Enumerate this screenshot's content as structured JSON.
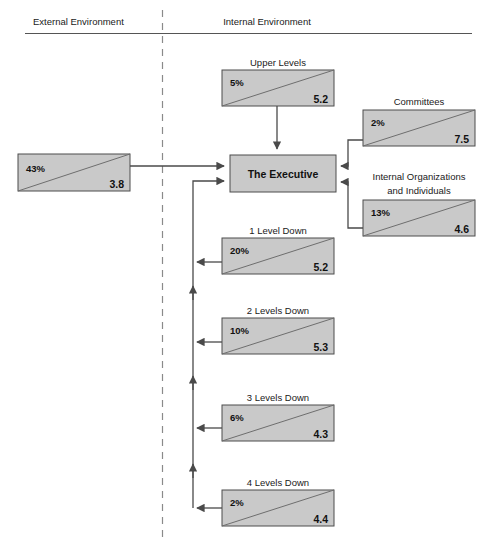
{
  "header": {
    "external_label": "External Environment",
    "internal_label": "Internal Environment"
  },
  "nodes": {
    "external": {
      "caption": "",
      "percent": "43%",
      "value": "3.8"
    },
    "upper_levels": {
      "caption": "Upper Levels",
      "percent": "5%",
      "value": "5.2"
    },
    "committees": {
      "caption": "Committees",
      "percent": "2%",
      "value": "7.5"
    },
    "internal_orgs": {
      "caption_line1": "Internal Organizations",
      "caption_line2": "and Individuals",
      "percent": "13%",
      "value": "4.6"
    },
    "executive": {
      "label": "The Executive"
    },
    "level1": {
      "caption": "1 Level Down",
      "percent": "20%",
      "value": "5.2"
    },
    "level2": {
      "caption": "2 Levels Down",
      "percent": "10%",
      "value": "5.3"
    },
    "level3": {
      "caption": "3 Levels Down",
      "percent": "6%",
      "value": "4.3"
    },
    "level4": {
      "caption": "4 Levels Down",
      "percent": "2%",
      "value": "4.4"
    }
  },
  "colors": {
    "node_fill": "#c9c9c9",
    "node_stroke": "#4c4c4c",
    "connector": "#4a4a4a",
    "divider": "#8a8a8a",
    "text": "#1a1a1a"
  }
}
